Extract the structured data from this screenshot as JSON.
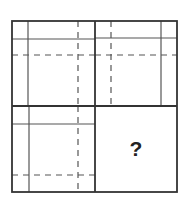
{
  "puzzle": {
    "type": "2x2 matrix reasoning puzzle",
    "missing_cell_label": "?",
    "cells": [
      {
        "position": "top-left",
        "solid_vertical": "left",
        "solid_horizontal": "top",
        "dashed_vertical": "right",
        "dashed_horizontal": "upper-middle"
      },
      {
        "position": "top-right",
        "solid_vertical": "right",
        "solid_horizontal": "top",
        "dashed_vertical": "left",
        "dashed_horizontal": "upper-middle"
      },
      {
        "position": "bottom-left",
        "solid_vertical": "left",
        "solid_horizontal": "top",
        "dashed_vertical": "right",
        "dashed_horizontal": "bottom"
      },
      {
        "position": "bottom-right",
        "content": "?"
      }
    ]
  },
  "colors": {
    "border": "#333333",
    "line": "#555555",
    "dashed": "#555555",
    "background": "#ffffff"
  }
}
